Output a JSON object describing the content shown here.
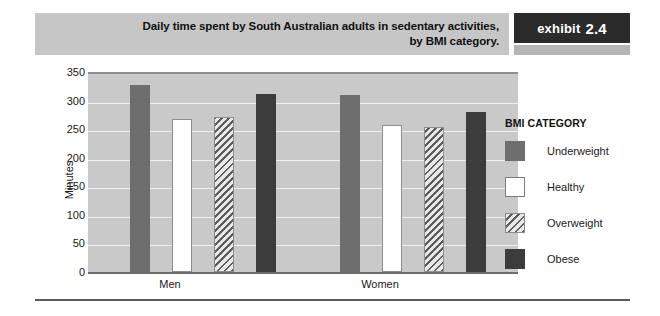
{
  "exhibit": {
    "title": "Daily time spent by South Australian adults in sedentary activities, by BMI category.",
    "title_line1": "Daily time spent by South Australian adults in sedentary activities,",
    "title_line2": "by BMI category.",
    "label_word": "exhibit",
    "label_number": "2.4"
  },
  "legend": {
    "title": "BMI CATEGORY",
    "items": [
      {
        "label": "Underweight",
        "swatch": "solid-medium-gray",
        "color": "#6e6e6e"
      },
      {
        "label": "Healthy",
        "swatch": "white-outline",
        "color": "#ffffff"
      },
      {
        "label": "Overweight",
        "swatch": "diagonal-hatch",
        "color": "#dcdcdc"
      },
      {
        "label": "Obese",
        "swatch": "solid-dark-gray",
        "color": "#3c3c3c"
      }
    ]
  },
  "chart_data": {
    "type": "bar",
    "title": "Daily time spent by South Australian adults in sedentary activities, by BMI category.",
    "xlabel": "",
    "ylabel": "Minutes",
    "categories": [
      "Men",
      "Women"
    ],
    "series": [
      {
        "name": "Underweight",
        "values": [
          328,
          310
        ]
      },
      {
        "name": "Healthy",
        "values": [
          267,
          257
        ]
      },
      {
        "name": "Overweight",
        "values": [
          272,
          254
        ]
      },
      {
        "name": "Obese",
        "values": [
          312,
          280
        ]
      }
    ],
    "ylim": [
      0,
      350
    ],
    "ytick_labels": [
      "350",
      "300",
      "250",
      "200",
      "150",
      "100",
      "50",
      "0"
    ],
    "yticks": [
      350,
      300,
      250,
      200,
      150,
      100,
      50,
      0
    ],
    "grid": true,
    "legend_position": "right",
    "plot_background": "#c9c9c9"
  }
}
